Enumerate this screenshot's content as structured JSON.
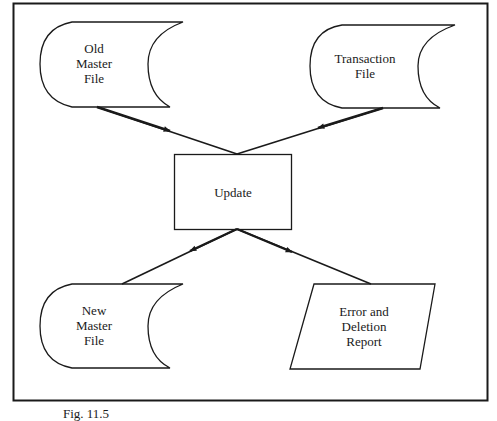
{
  "diagram": {
    "nodes": {
      "old_master": {
        "label": "Old\nMaster\nFile",
        "shape": "stored-data"
      },
      "transaction": {
        "label": "Transaction\nFile",
        "shape": "stored-data"
      },
      "update": {
        "label": "Update",
        "shape": "process"
      },
      "new_master": {
        "label": "New\nMaster\nFile",
        "shape": "stored-data"
      },
      "report": {
        "label": "Error and\nDeletion\nReport",
        "shape": "input-output"
      }
    },
    "edges": [
      {
        "from": "Old Master File",
        "to": "Update"
      },
      {
        "from": "Transaction File",
        "to": "Update"
      },
      {
        "from": "Update",
        "to": "New Master File"
      },
      {
        "from": "Update",
        "to": "Error and Deletion Report"
      }
    ],
    "colors": {
      "stroke": "#1a1a1a",
      "background": "#ffffff"
    }
  },
  "caption": "Fig. 11.5"
}
